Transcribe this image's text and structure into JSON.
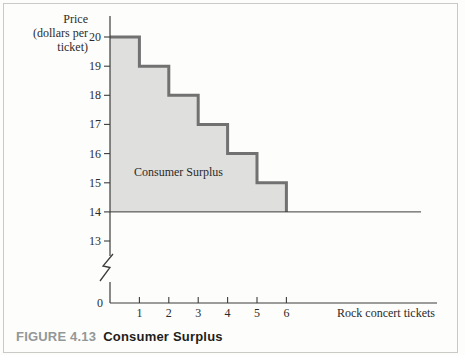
{
  "figure": {
    "caption_label": "FIGURE 4.13",
    "caption_title": "Consumer Surplus",
    "caption_label_color": "#939797",
    "caption_title_color": "#1e1e1e"
  },
  "chart": {
    "y_axis_title": "Price\n(dollars per\nticket)",
    "x_axis_title": "Rock concert tickets",
    "area_label": "Consumer Surplus"
  },
  "chart_data": {
    "type": "area",
    "subtype": "step-demand-curve-with-consumer-surplus",
    "xlabel": "Rock concert tickets",
    "ylabel": "Price (dollars per ticket)",
    "x_ticks": [
      1,
      2,
      3,
      4,
      5,
      6
    ],
    "y_ticks": [
      13,
      14,
      15,
      16,
      17,
      18,
      19,
      20
    ],
    "origin_tick_label": "0",
    "y_axis_break": true,
    "steps": [
      {
        "ticket": 1,
        "price": 20
      },
      {
        "ticket": 2,
        "price": 19
      },
      {
        "ticket": 3,
        "price": 18
      },
      {
        "ticket": 4,
        "price": 17
      },
      {
        "ticket": 5,
        "price": 16
      },
      {
        "ticket": 6,
        "price": 15
      }
    ],
    "market_price": 14,
    "shaded_region_label": "Consumer Surplus",
    "xlim": [
      0,
      6
    ],
    "ylim": [
      13,
      20
    ],
    "grid": false,
    "legend": "none",
    "colors": {
      "area_fill": "#dfdfdd",
      "step_stroke": "#717171",
      "axis_stroke": "#3c3c3c",
      "label_text": "#2b2b2b"
    }
  }
}
